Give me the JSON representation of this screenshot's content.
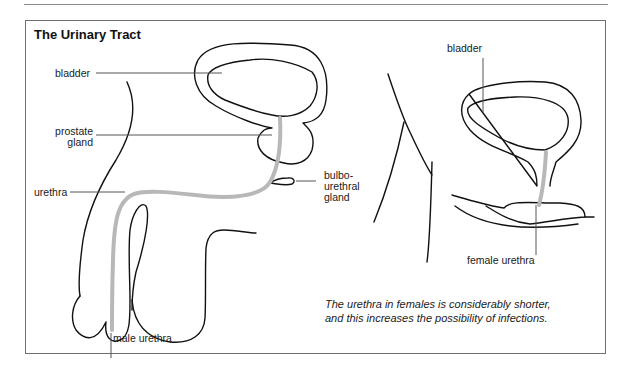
{
  "figure": {
    "title": "The Urinary Tract",
    "colors": {
      "outline": "#111111",
      "urethra": "#b8b8b8",
      "leader": "#555555",
      "frame": "#6f6f6f"
    },
    "male_diagram": {
      "labels": {
        "bladder": "bladder",
        "prostate_line1": "prostate",
        "prostate_line2": "gland",
        "urethra": "urethra",
        "bulbo_line1": "bulbo-",
        "bulbo_line2": "urethral",
        "bulbo_line3": "gland",
        "male_urethra": "male urethra"
      }
    },
    "female_diagram": {
      "labels": {
        "bladder": "bladder",
        "female_urethra": "female urethra"
      }
    },
    "caption": {
      "line1": "The urethra in females is considerably shorter,",
      "line2": "and this increases the possibility of infections."
    }
  }
}
